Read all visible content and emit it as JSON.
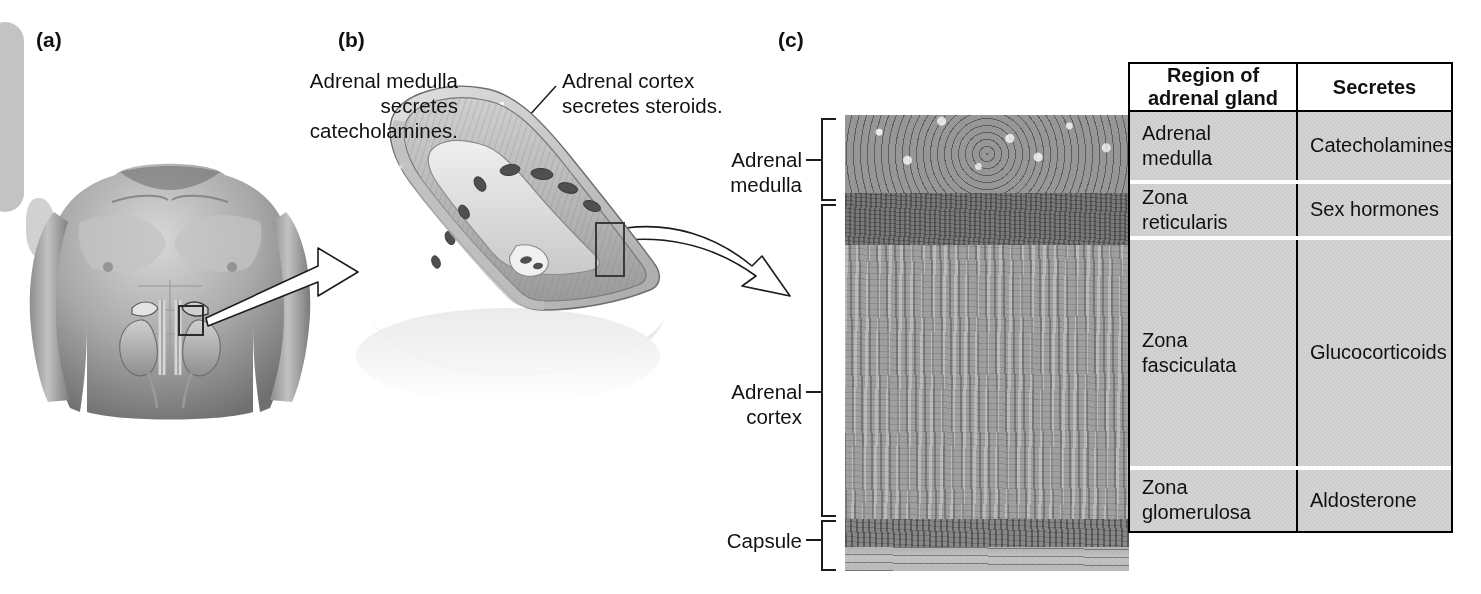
{
  "figure": {
    "panels": [
      {
        "id": "a",
        "letter": "(a)"
      },
      {
        "id": "b",
        "letter": "(b)"
      },
      {
        "id": "c",
        "letter": "(c)"
      }
    ]
  },
  "panel_b": {
    "callout_left": "Adrenal medulla\nsecretes\ncatecholamines.",
    "callout_right": "Adrenal cortex\nsecretes steroids."
  },
  "panel_c": {
    "brackets": [
      {
        "name": "adrenal-medulla",
        "label": "Adrenal\nmedulla"
      },
      {
        "name": "adrenal-cortex",
        "label": "Adrenal\ncortex"
      },
      {
        "name": "capsule",
        "label": "Capsule"
      }
    ],
    "micrograph_layers": [
      {
        "name": "adrenal-medulla"
      },
      {
        "name": "zona-reticularis"
      },
      {
        "name": "zona-fasciculata"
      },
      {
        "name": "zona-glomerulosa"
      },
      {
        "name": "capsule"
      }
    ]
  },
  "table": {
    "headers": [
      "Region of\nadrenal gland",
      "Secretes"
    ],
    "rows": [
      {
        "region": "Adrenal\nmedulla",
        "secretes": "Catecholamines"
      },
      {
        "region": "Zona\nreticularis",
        "secretes": "Sex hormones"
      },
      {
        "region": "Zona\nfasciculata",
        "secretes": "Glucocorticoids"
      },
      {
        "region": "Zona\nglomerulosa",
        "secretes": "Aldosterone"
      }
    ]
  },
  "colors": {
    "table_border": "#000000",
    "table_header_bg": "#ffffff",
    "table_cell_bg": "#d2d2d2",
    "text": "#111111",
    "background": "#ffffff"
  }
}
